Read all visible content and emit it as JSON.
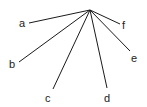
{
  "diagram": {
    "type": "radiating-lines",
    "apex": {
      "x": 90,
      "y": 10
    },
    "line_color": "#1a1a1a",
    "label_color": "#222222",
    "rays": [
      {
        "label": "a",
        "end": {
          "x": 29,
          "y": 23
        },
        "label_pos": {
          "x": 19,
          "y": 27
        }
      },
      {
        "label": "b",
        "end": {
          "x": 19,
          "y": 62
        },
        "label_pos": {
          "x": 9,
          "y": 68
        }
      },
      {
        "label": "c",
        "end": {
          "x": 53,
          "y": 89
        },
        "label_pos": {
          "x": 45,
          "y": 102
        }
      },
      {
        "label": "d",
        "end": {
          "x": 107,
          "y": 88
        },
        "label_pos": {
          "x": 104,
          "y": 102
        }
      },
      {
        "label": "e",
        "end": {
          "x": 130,
          "y": 51
        },
        "label_pos": {
          "x": 131,
          "y": 62
        }
      },
      {
        "label": "f",
        "end": {
          "x": 120,
          "y": 24
        },
        "label_pos": {
          "x": 122,
          "y": 29
        }
      }
    ]
  }
}
